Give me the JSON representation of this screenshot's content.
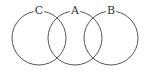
{
  "diagram": {
    "type": "venn",
    "sets": [
      {
        "label": "C",
        "cx": 39,
        "cy": 38,
        "r": 27
      },
      {
        "label": "A",
        "cx": 75,
        "cy": 38,
        "r": 27
      },
      {
        "label": "B",
        "cx": 111,
        "cy": 38,
        "r": 27
      }
    ],
    "stroke_color": "#555555",
    "background": "#ffffff"
  }
}
